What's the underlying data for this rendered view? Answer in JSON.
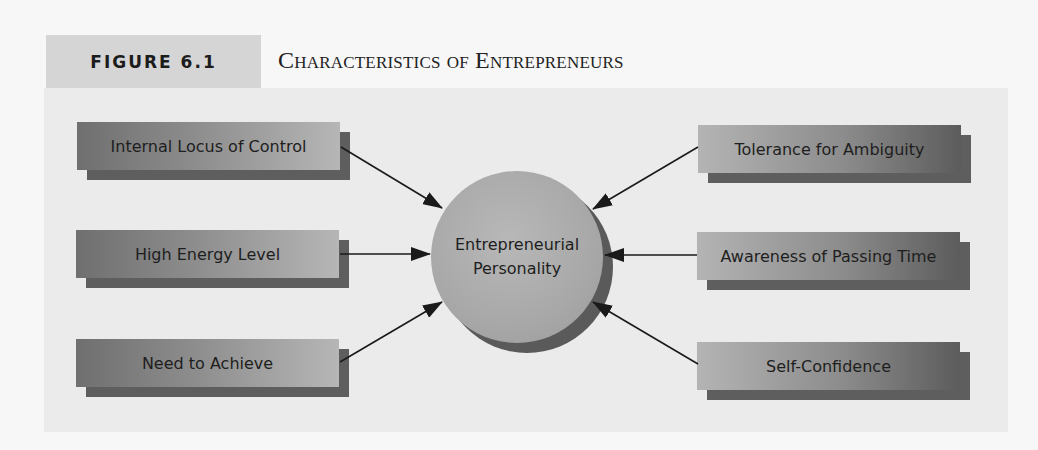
{
  "header": {
    "figure_label": "FIGURE 6.1",
    "title": "Characteristics of Entrepreneurs"
  },
  "center": {
    "line1": "Entrepreneurial",
    "line2": "Personality"
  },
  "left_items": [
    {
      "label": "Internal Locus of Control"
    },
    {
      "label": "High Energy Level"
    },
    {
      "label": "Need to Achieve"
    }
  ],
  "right_items": [
    {
      "label": "Tolerance for Ambiguity"
    },
    {
      "label": "Awareness of Passing Time"
    },
    {
      "label": "Self-Confidence"
    }
  ],
  "colors": {
    "label_bg": "#d5d5d5",
    "panel_bg": "#ebebeb",
    "box_dark": "#5e5e5e",
    "box_light": "#b6b6b6",
    "circle": "#a8a8a8",
    "arrow": "#1a1a1a"
  }
}
